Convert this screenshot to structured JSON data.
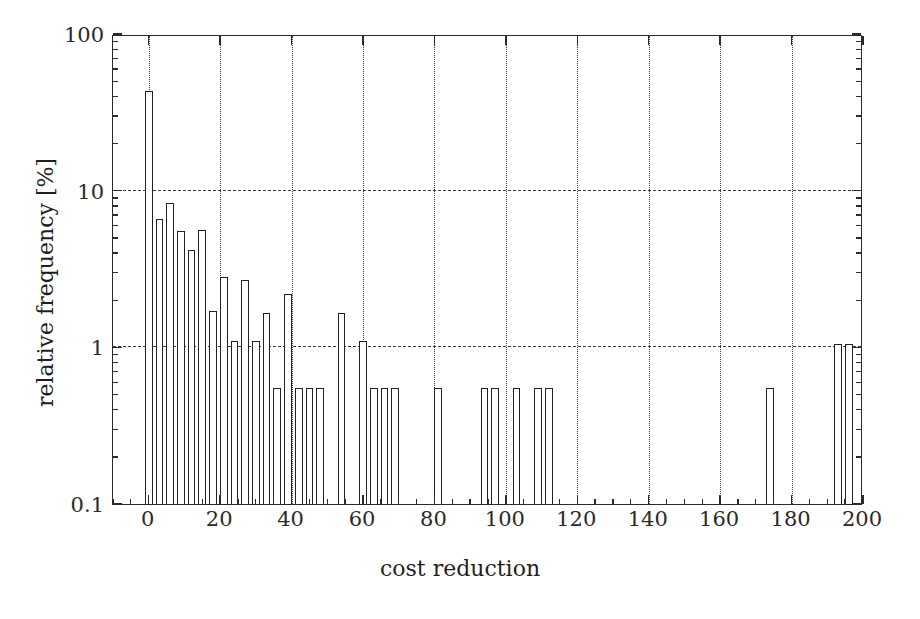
{
  "figure": {
    "background": "#ffffff",
    "axis_color": "#2b2b2b",
    "bar_edge_color": "#222222",
    "bar_fill_color": "#ffffff",
    "grid_color": "#3a3a3a"
  },
  "axis_titles": {
    "x": "cost reduction",
    "y": "relative frequency [%]"
  },
  "ticks": {
    "x_labels": [
      "0",
      "20",
      "40",
      "60",
      "80",
      "100",
      "120",
      "140",
      "160",
      "180",
      "200"
    ],
    "y_labels": [
      "0.1",
      "1",
      "10",
      "100"
    ]
  },
  "chart_data": {
    "type": "bar",
    "title": "",
    "subtitle": "",
    "xlabel": "cost reduction",
    "ylabel": "relative frequency [%]",
    "yscale": "log",
    "xscale": "linear",
    "xlim": [
      -10,
      200
    ],
    "ylim": [
      0.1,
      100
    ],
    "grid": true,
    "grid_axes": "both",
    "legend": null,
    "bar_width": 2.2,
    "annotations": [],
    "series": [
      {
        "name": "relative frequency",
        "x": [
          0,
          3,
          6,
          9,
          12,
          15,
          18,
          21,
          24,
          27,
          30,
          33,
          36,
          39,
          42,
          45,
          48,
          54,
          60,
          63,
          66,
          69,
          81,
          94,
          97,
          103,
          109,
          112,
          174,
          193,
          196
        ],
        "values": [
          43.0,
          6.6,
          8.3,
          5.5,
          4.2,
          5.6,
          1.7,
          2.8,
          1.1,
          2.7,
          1.1,
          1.65,
          0.55,
          2.2,
          0.55,
          0.55,
          0.55,
          1.65,
          1.1,
          0.55,
          0.55,
          0.55,
          0.55,
          0.55,
          0.55,
          0.55,
          0.55,
          0.55,
          0.55,
          1.05,
          1.05
        ]
      }
    ],
    "categories": []
  }
}
